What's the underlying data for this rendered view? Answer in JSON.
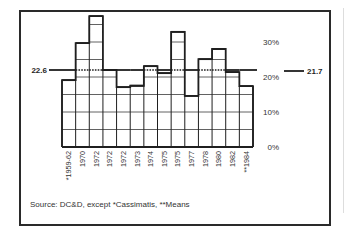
{
  "chart_data": {
    "type": "bar",
    "title": "",
    "xlabel": "",
    "ylabel": "",
    "categories": [
      "*1959-62",
      "1970",
      "1972",
      "1972",
      "1972",
      "1973",
      "1974",
      "1975",
      "1975",
      "1977",
      "1978",
      "1980",
      "1982",
      "**1984"
    ],
    "values": [
      19.1,
      29.7,
      37.4,
      22.0,
      17.1,
      17.5,
      23.1,
      21.1,
      32.9,
      14.6,
      25.1,
      28.0,
      21.4,
      17.4
    ],
    "ylim": [
      0,
      40
    ],
    "y_ticks": [
      {
        "value": 0,
        "label": "0%"
      },
      {
        "value": 10,
        "label": "10%"
      },
      {
        "value": 20,
        "label": "20%"
      },
      {
        "value": 30,
        "label": "30%"
      }
    ],
    "grid": {
      "on": true,
      "step": 5
    },
    "reference_lines": [
      {
        "name": "mean-left",
        "value": 22.6,
        "label": "22.6"
      },
      {
        "name": "mean-right",
        "value": 21.7,
        "label": "21.7"
      }
    ],
    "annotations": [
      "Source: DC&D, except *Cassimatis, **Means"
    ]
  },
  "source_note": "Source: DC&D, except *Cassimatis, **Means",
  "colors": {
    "ink": "#1f1f1f",
    "grid": "#3a3a3a",
    "background": "#ffffff"
  }
}
